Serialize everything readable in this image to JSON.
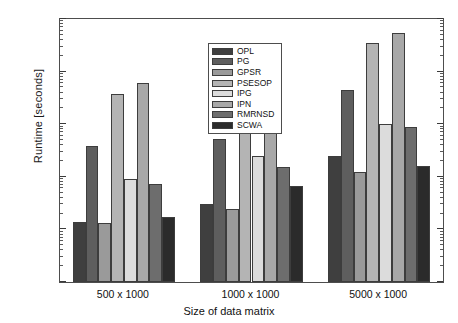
{
  "chart_data": {
    "type": "bar",
    "title": "",
    "xlabel": "Size of data matrix",
    "ylabel": "Runtime [seconds]",
    "yscale": "log",
    "ylim": [
      1,
      100000
    ],
    "ytick_labels": [
      "10^0",
      "10^1",
      "10^2",
      "10^3",
      "10^4",
      "10^5"
    ],
    "ytick_values": [
      1,
      10,
      100,
      1000,
      10000,
      100000
    ],
    "grid": false,
    "legend_position": "upper center",
    "categories": [
      "500 x 1000",
      "1000 x 1000",
      "5000 x 1000"
    ],
    "series": [
      {
        "name": "OPL",
        "color": "#3f3f3f",
        "values": [
          14,
          31,
          250
        ]
      },
      {
        "name": "PG",
        "color": "#5e5e5e",
        "values": [
          380,
          530,
          4500
        ]
      },
      {
        "name": "GPSR",
        "color": "#9a9a9a",
        "values": [
          13,
          24,
          125
        ]
      },
      {
        "name": "PSESOP",
        "color": "#b4b4b4",
        "values": [
          3800,
          7000,
          35000
        ]
      },
      {
        "name": "IPG",
        "color": "#dcdcdc",
        "values": [
          92,
          245,
          1000
        ]
      },
      {
        "name": "IPN",
        "color": "#a8a8a8",
        "values": [
          6000,
          11500,
          55000
        ]
      },
      {
        "name": "RMRNSD",
        "color": "#6d6d6d",
        "values": [
          72,
          155,
          880
        ]
      },
      {
        "name": "SCWA",
        "color": "#2b2b2b",
        "values": [
          17,
          66,
          160
        ]
      }
    ]
  },
  "axis": {
    "y_title": "Runtime [seconds]",
    "x_title": "Size of data matrix",
    "y_ticks": [
      {
        "mantissa": "10",
        "exponent": "5"
      },
      {
        "mantissa": "10",
        "exponent": "4"
      },
      {
        "mantissa": "10",
        "exponent": "3"
      },
      {
        "mantissa": "10",
        "exponent": "2"
      },
      {
        "mantissa": "10",
        "exponent": "1"
      },
      {
        "mantissa": "10",
        "exponent": "0"
      }
    ]
  },
  "legend": {
    "items": [
      {
        "label": "OPL"
      },
      {
        "label": "PG"
      },
      {
        "label": "GPSR"
      },
      {
        "label": "PSESOP"
      },
      {
        "label": "IPG"
      },
      {
        "label": "IPN"
      },
      {
        "label": "RMRNSD"
      },
      {
        "label": "SCWA"
      }
    ]
  }
}
